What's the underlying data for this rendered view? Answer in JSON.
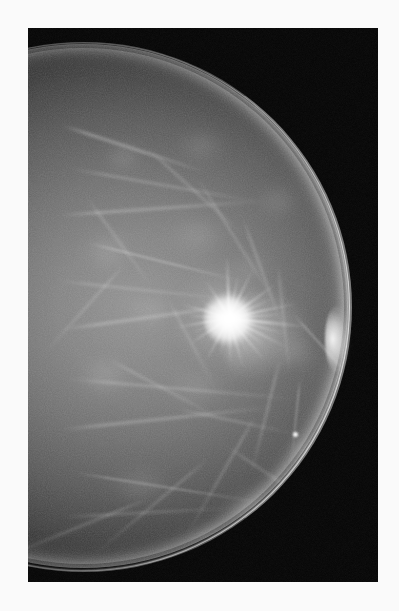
{
  "image": {
    "kind": "mammogram-radiograph",
    "modality": "Mammography",
    "view": "craniocaudal",
    "laterality_hint": "chest-wall at left edge, nipple projected at right",
    "caption": "",
    "width_px": 399,
    "height_px": 611
  },
  "film": {
    "plate_left": 28,
    "plate_top": 28,
    "plate_width": 350,
    "plate_height": 554,
    "background_color": "#040404",
    "margin_color": "#fafafa"
  },
  "anatomy": {
    "breast": {
      "label": "breast parenchyma",
      "tissue_pattern": "heterogeneously dense fibroglandular",
      "tone_bright": "#8e8e8e",
      "tone_mid": "#6a6a6a",
      "tone_dark": "#232323"
    },
    "skin_line": {
      "label": "skin line",
      "color": "#ffffff"
    },
    "nipple": {
      "label": "nipple in profile",
      "x": 310,
      "y": 311
    },
    "pectoral_edge": {
      "label": "chest wall margin",
      "x": 28
    }
  },
  "finding": {
    "label": "spiculated mass",
    "center_x": 206,
    "center_y": 289,
    "core_diameter_px": 56,
    "spicule_count": 26,
    "core_color": "#ffffff",
    "secondary_label": "architectural distortion",
    "secondary_center_x": 262,
    "secondary_center_y": 320
  },
  "spicules": [
    {
      "angle": -92,
      "length": 62,
      "thickness": 2.6
    },
    {
      "angle": -78,
      "length": 44,
      "thickness": 1.6
    },
    {
      "angle": -64,
      "length": 55,
      "thickness": 2.0
    },
    {
      "angle": -50,
      "length": 38,
      "thickness": 1.4
    },
    {
      "angle": -36,
      "length": 60,
      "thickness": 2.2
    },
    {
      "angle": -24,
      "length": 46,
      "thickness": 1.5
    },
    {
      "angle": -12,
      "length": 72,
      "thickness": 2.4
    },
    {
      "angle": -4,
      "length": 54,
      "thickness": 1.6
    },
    {
      "angle": 6,
      "length": 80,
      "thickness": 2.8
    },
    {
      "angle": 16,
      "length": 58,
      "thickness": 1.8
    },
    {
      "angle": 27,
      "length": 66,
      "thickness": 2.2
    },
    {
      "angle": 38,
      "length": 44,
      "thickness": 1.5
    },
    {
      "angle": 50,
      "length": 57,
      "thickness": 2.0
    },
    {
      "angle": 62,
      "length": 40,
      "thickness": 1.4
    },
    {
      "angle": 74,
      "length": 52,
      "thickness": 1.8
    },
    {
      "angle": 88,
      "length": 46,
      "thickness": 2.0
    },
    {
      "angle": 103,
      "length": 38,
      "thickness": 1.5
    },
    {
      "angle": 118,
      "length": 50,
      "thickness": 1.9
    },
    {
      "angle": 132,
      "length": 34,
      "thickness": 1.3
    },
    {
      "angle": 146,
      "length": 48,
      "thickness": 1.8
    },
    {
      "angle": 158,
      "length": 40,
      "thickness": 1.4
    },
    {
      "angle": 170,
      "length": 56,
      "thickness": 2.1
    },
    {
      "angle": 182,
      "length": 42,
      "thickness": 1.5
    },
    {
      "angle": 196,
      "length": 50,
      "thickness": 1.9
    },
    {
      "angle": 212,
      "length": 36,
      "thickness": 1.3
    },
    {
      "angle": 238,
      "length": 44,
      "thickness": 1.6
    }
  ],
  "trabeculae": [
    {
      "x": 34,
      "y": 96,
      "w": 150,
      "h": 3,
      "angle": 18,
      "opacity": 0.3,
      "blur": 1.6
    },
    {
      "x": 44,
      "y": 140,
      "w": 190,
      "h": 2,
      "angle": 10,
      "opacity": 0.26,
      "blur": 1.4
    },
    {
      "x": 30,
      "y": 186,
      "w": 210,
      "h": 3,
      "angle": -4,
      "opacity": 0.24,
      "blur": 1.8
    },
    {
      "x": 60,
      "y": 214,
      "w": 160,
      "h": 2,
      "angle": 14,
      "opacity": 0.28,
      "blur": 1.2
    },
    {
      "x": 30,
      "y": 252,
      "w": 180,
      "h": 2,
      "angle": 6,
      "opacity": 0.22,
      "blur": 1.5
    },
    {
      "x": 34,
      "y": 300,
      "w": 200,
      "h": 3,
      "angle": -8,
      "opacity": 0.25,
      "blur": 1.7
    },
    {
      "x": 40,
      "y": 350,
      "w": 230,
      "h": 2,
      "angle": 5,
      "opacity": 0.27,
      "blur": 1.4
    },
    {
      "x": 34,
      "y": 400,
      "w": 215,
      "h": 3,
      "angle": -6,
      "opacity": 0.24,
      "blur": 1.8
    },
    {
      "x": 48,
      "y": 444,
      "w": 190,
      "h": 2,
      "angle": 9,
      "opacity": 0.26,
      "blur": 1.3
    },
    {
      "x": 36,
      "y": 488,
      "w": 175,
      "h": 2,
      "angle": -3,
      "opacity": 0.22,
      "blur": 1.6
    },
    {
      "x": 120,
      "y": 120,
      "w": 130,
      "h": 2,
      "angle": 42,
      "opacity": 0.24,
      "blur": 1.5
    },
    {
      "x": 170,
      "y": 150,
      "w": 150,
      "h": 2,
      "angle": 58,
      "opacity": 0.22,
      "blur": 1.6
    },
    {
      "x": 215,
      "y": 190,
      "w": 120,
      "h": 2,
      "angle": 70,
      "opacity": 0.25,
      "blur": 1.4
    },
    {
      "x": 250,
      "y": 236,
      "w": 110,
      "h": 2,
      "angle": 84,
      "opacity": 0.23,
      "blur": 1.5
    },
    {
      "x": 252,
      "y": 330,
      "w": 120,
      "h": 2,
      "angle": 104,
      "opacity": 0.26,
      "blur": 1.4
    },
    {
      "x": 228,
      "y": 386,
      "w": 140,
      "h": 2,
      "angle": 120,
      "opacity": 0.24,
      "blur": 1.6
    },
    {
      "x": 180,
      "y": 430,
      "w": 150,
      "h": 2,
      "angle": 140,
      "opacity": 0.22,
      "blur": 1.5
    },
    {
      "x": 120,
      "y": 470,
      "w": 160,
      "h": 2,
      "angle": 158,
      "opacity": 0.24,
      "blur": 1.6
    },
    {
      "x": 96,
      "y": 236,
      "w": 120,
      "h": 2,
      "angle": 132,
      "opacity": 0.21,
      "blur": 1.4
    },
    {
      "x": 80,
      "y": 330,
      "w": 130,
      "h": 2,
      "angle": 28,
      "opacity": 0.23,
      "blur": 1.5
    },
    {
      "x": 140,
      "y": 270,
      "w": 100,
      "h": 2,
      "angle": 62,
      "opacity": 0.2,
      "blur": 1.6
    },
    {
      "x": 200,
      "y": 418,
      "w": 110,
      "h": 2,
      "angle": 34,
      "opacity": 0.22,
      "blur": 1.4
    },
    {
      "x": 60,
      "y": 170,
      "w": 110,
      "h": 2,
      "angle": 54,
      "opacity": 0.22,
      "blur": 1.5
    },
    {
      "x": 266,
      "y": 286,
      "w": 90,
      "h": 2,
      "angle": 48,
      "opacity": 0.26,
      "blur": 1.2
    },
    {
      "x": 272,
      "y": 350,
      "w": 80,
      "h": 2,
      "angle": 96,
      "opacity": 0.24,
      "blur": 1.3
    },
    {
      "x": 150,
      "y": 380,
      "w": 120,
      "h": 2,
      "angle": 12,
      "opacity": 0.23,
      "blur": 1.5
    }
  ],
  "lobules": [
    {
      "x": 70,
      "y": 110,
      "w": 54,
      "h": 40,
      "opacity": 0.16
    },
    {
      "x": 140,
      "y": 96,
      "w": 70,
      "h": 46,
      "opacity": 0.14
    },
    {
      "x": 48,
      "y": 200,
      "w": 66,
      "h": 50,
      "opacity": 0.15
    },
    {
      "x": 130,
      "y": 180,
      "w": 82,
      "h": 56,
      "opacity": 0.13
    },
    {
      "x": 220,
      "y": 150,
      "w": 62,
      "h": 48,
      "opacity": 0.14
    },
    {
      "x": 40,
      "y": 320,
      "w": 76,
      "h": 58,
      "opacity": 0.15
    },
    {
      "x": 126,
      "y": 330,
      "w": 88,
      "h": 60,
      "opacity": 0.12
    },
    {
      "x": 236,
      "y": 300,
      "w": 70,
      "h": 52,
      "opacity": 0.14
    },
    {
      "x": 70,
      "y": 430,
      "w": 90,
      "h": 56,
      "opacity": 0.13
    },
    {
      "x": 180,
      "y": 452,
      "w": 84,
      "h": 54,
      "opacity": 0.12
    },
    {
      "x": 250,
      "y": 402,
      "w": 60,
      "h": 46,
      "opacity": 0.14
    },
    {
      "x": 96,
      "y": 262,
      "w": 60,
      "h": 44,
      "opacity": 0.13
    },
    {
      "x": 196,
      "y": 220,
      "w": 56,
      "h": 40,
      "opacity": 0.12
    },
    {
      "x": 152,
      "y": 496,
      "w": 70,
      "h": 44,
      "opacity": 0.11
    }
  ],
  "calcification": {
    "label": "punctate density",
    "x": 265,
    "y": 404,
    "size": 5
  }
}
